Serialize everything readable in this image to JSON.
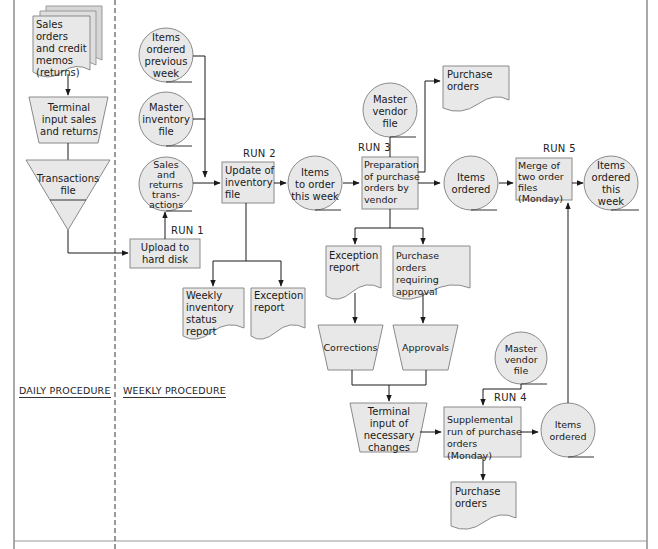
{
  "colors": {
    "fill": "#e8e8e8",
    "stroke": "#8a8a8a",
    "line": "#1a1a1a",
    "border": "#555555"
  },
  "sections": {
    "daily": "DAILY PROCEDURE",
    "weekly": "WEEKLY PROCEDURE"
  },
  "runs": {
    "run1": "RUN 1",
    "run2": "RUN 2",
    "run3": "RUN 3",
    "run4": "RUN 4",
    "run5": "RUN 5"
  },
  "documents": {
    "sales_orders": [
      "Sales orders",
      "and credit",
      "memos",
      "(returns)"
    ],
    "purchase_orders_top": [
      "Purchase",
      "orders"
    ],
    "weekly_inventory_report": [
      "Weekly",
      "inventory",
      "status report"
    ],
    "exception_report_1": [
      "Exception",
      "report"
    ],
    "exception_report_2": [
      "Exception",
      "report"
    ],
    "purchase_orders_approval": [
      "Purchase",
      "orders requiring",
      "approval"
    ],
    "purchase_orders_bottom": [
      "Purchase",
      "orders"
    ]
  },
  "manual_inputs": {
    "terminal_input_sales": [
      "Terminal",
      "input sales",
      "and returns"
    ],
    "corrections": [
      "Corrections"
    ],
    "approvals": [
      "Approvals"
    ],
    "terminal_input_changes": [
      "Terminal",
      "input of",
      "necessary",
      "changes"
    ]
  },
  "offline_files": {
    "transactions_file": [
      "Transactions",
      "file"
    ]
  },
  "disk_files": {
    "items_ordered_previous_week": [
      "Items",
      "ordered",
      "previous",
      "week"
    ],
    "master_inventory_file": [
      "Master",
      "inventory",
      "file"
    ],
    "sales_returns_transactions": [
      "Sales",
      "and",
      "returns",
      "trans-",
      "actions"
    ],
    "items_to_order": [
      "Items",
      "to order",
      "this week"
    ],
    "master_vendor_file_1": [
      "Master",
      "vendor",
      "file"
    ],
    "items_ordered_1": [
      "Items",
      "ordered"
    ],
    "items_ordered_this_week": [
      "Items",
      "ordered",
      "this",
      "week"
    ],
    "master_vendor_file_2": [
      "Master",
      "vendor",
      "file"
    ],
    "items_ordered_2": [
      "Items",
      "ordered"
    ]
  },
  "processes": {
    "upload": [
      "Upload to",
      "hard disk"
    ],
    "update_inventory": [
      "Update of",
      "inventory",
      "file"
    ],
    "preparation_po": [
      "Preparation",
      "of purchase",
      "orders by",
      "vendor"
    ],
    "merge": [
      "Merge of",
      "two order",
      "files",
      "(Monday)"
    ],
    "supplemental": [
      "Supplemental",
      "run of purchase",
      "orders (Monday)"
    ]
  }
}
